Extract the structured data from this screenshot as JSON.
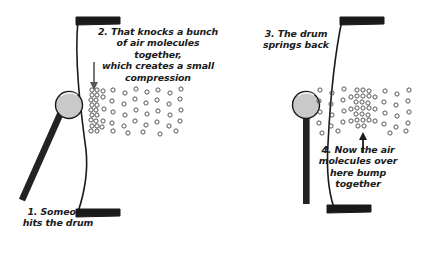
{
  "figure": {
    "background_color": "#ffffff",
    "ink_color": "#1a1a1a",
    "mallet_head_color": "#c9c9c9",
    "molecule_stroke": "#555555"
  },
  "captions": {
    "step1": "1. Someone\nhits the drum",
    "step2": "2. That knocks a bunch\nof air molecules together,\nwhich creates a small\ncompression",
    "step3": "3. The drum\nsprings back",
    "step4": "4. Now the air\nmolecules over\nhere bump\ntogether"
  },
  "panels": [
    {
      "name": "left-panel",
      "step_labels": [
        "step1",
        "step2"
      ],
      "drum_state": "struck-inward",
      "arrow": {
        "direction": "down",
        "label": "compression-arrow"
      }
    },
    {
      "name": "right-panel",
      "step_labels": [
        "step3",
        "step4"
      ],
      "drum_state": "sprung-back",
      "arrow": {
        "direction": "up",
        "label": "compression-arrow"
      }
    }
  ],
  "molecules": {
    "left_dense_cluster": [
      [
        92,
        90
      ],
      [
        97,
        90
      ],
      [
        103,
        91
      ],
      [
        92,
        95
      ],
      [
        97,
        95
      ],
      [
        91,
        100
      ],
      [
        96,
        100
      ],
      [
        92,
        105
      ],
      [
        97,
        105
      ],
      [
        91,
        110
      ],
      [
        96,
        110
      ],
      [
        92,
        115
      ],
      [
        97,
        115
      ],
      [
        91,
        120
      ],
      [
        96,
        121
      ],
      [
        92,
        126
      ],
      [
        97,
        126
      ],
      [
        103,
        97
      ],
      [
        104,
        109
      ],
      [
        103,
        121
      ],
      [
        102,
        127
      ],
      [
        91,
        131
      ],
      [
        97,
        131
      ]
    ],
    "left_sparse_field": [
      [
        113,
        90
      ],
      [
        125,
        93
      ],
      [
        136,
        89
      ],
      [
        147,
        92
      ],
      [
        158,
        90
      ],
      [
        170,
        93
      ],
      [
        181,
        89
      ],
      [
        112,
        101
      ],
      [
        124,
        104
      ],
      [
        135,
        99
      ],
      [
        146,
        103
      ],
      [
        157,
        100
      ],
      [
        169,
        104
      ],
      [
        180,
        99
      ],
      [
        113,
        112
      ],
      [
        125,
        115
      ],
      [
        136,
        110
      ],
      [
        147,
        114
      ],
      [
        158,
        111
      ],
      [
        170,
        115
      ],
      [
        181,
        110
      ],
      [
        112,
        123
      ],
      [
        124,
        126
      ],
      [
        135,
        121
      ],
      [
        146,
        125
      ],
      [
        157,
        122
      ],
      [
        169,
        126
      ],
      [
        180,
        121
      ],
      [
        113,
        131
      ],
      [
        128,
        133
      ],
      [
        143,
        132
      ],
      [
        160,
        134
      ],
      [
        176,
        131
      ]
    ],
    "right_dense_cluster": [
      [
        357,
        90
      ],
      [
        363,
        90
      ],
      [
        369,
        91
      ],
      [
        357,
        96
      ],
      [
        363,
        96
      ],
      [
        369,
        96
      ],
      [
        356,
        102
      ],
      [
        362,
        102
      ],
      [
        368,
        103
      ],
      [
        357,
        108
      ],
      [
        363,
        108
      ],
      [
        369,
        108
      ],
      [
        356,
        114
      ],
      [
        362,
        114
      ],
      [
        368,
        115
      ],
      [
        357,
        120
      ],
      [
        363,
        120
      ],
      [
        369,
        120
      ],
      [
        358,
        126
      ],
      [
        364,
        126
      ],
      [
        351,
        97
      ],
      [
        351,
        109
      ],
      [
        351,
        121
      ],
      [
        375,
        97
      ],
      [
        375,
        109
      ],
      [
        375,
        121
      ]
    ],
    "right_sparse_field": [
      [
        320,
        90
      ],
      [
        332,
        93
      ],
      [
        344,
        89
      ],
      [
        385,
        91
      ],
      [
        397,
        94
      ],
      [
        409,
        90
      ],
      [
        319,
        101
      ],
      [
        331,
        104
      ],
      [
        343,
        100
      ],
      [
        384,
        102
      ],
      [
        396,
        105
      ],
      [
        408,
        101
      ],
      [
        320,
        112
      ],
      [
        332,
        115
      ],
      [
        344,
        111
      ],
      [
        385,
        113
      ],
      [
        397,
        116
      ],
      [
        409,
        112
      ],
      [
        319,
        123
      ],
      [
        331,
        126
      ],
      [
        343,
        122
      ],
      [
        384,
        124
      ],
      [
        396,
        127
      ],
      [
        408,
        123
      ],
      [
        322,
        133
      ],
      [
        338,
        131
      ],
      [
        390,
        133
      ],
      [
        406,
        131
      ]
    ]
  }
}
